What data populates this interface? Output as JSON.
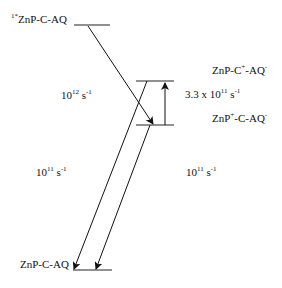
{
  "levels": {
    "excited": {
      "prefix": "1*",
      "label": "ZnP-C-AQ"
    },
    "ct_upper": {
      "label": "ZnP-C",
      "sup1": "+",
      "mid": "-AQ",
      "sup2": "-"
    },
    "ct_lower": {
      "label": "ZnP",
      "sup1": "+",
      "mid": "-C-AQ",
      "sup2": "-"
    },
    "ground": {
      "label": "ZnP-C-AQ"
    }
  },
  "rates": {
    "forward": {
      "base": "10",
      "exp": "12",
      "unit": " s",
      "unitexp": "-1"
    },
    "shift": {
      "base": "3.3 x 10",
      "exp": "11",
      "unit": " s",
      "unitexp": "-1"
    },
    "recomb_left": {
      "base": "10",
      "exp": "11",
      "unit": " s",
      "unitexp": "-1"
    },
    "recomb_right": {
      "base": "10",
      "exp": "11",
      "unit": " s",
      "unitexp": "-1"
    }
  }
}
